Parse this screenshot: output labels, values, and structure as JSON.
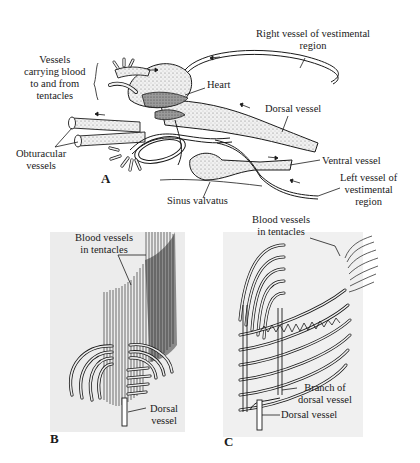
{
  "figure": {
    "panels": [
      {
        "id": "A",
        "letter": "A",
        "labels": {
          "right_vessel": [
            "Right vessel of vestimental",
            "region"
          ],
          "vessels_tentacles": [
            "Vessels",
            "carrying blood",
            "to and from",
            "tentacles"
          ],
          "heart": "Heart",
          "dorsal_vessel": "Dorsal vessel",
          "obturacular": [
            "Obturacular",
            "vessels"
          ],
          "ventral_vessel": "Ventral vessel",
          "left_vessel": [
            "Left vessel of",
            "vestimental",
            "region"
          ],
          "sinus_valvatus": "Sinus valvatus"
        }
      },
      {
        "id": "B",
        "letter": "B",
        "labels": {
          "blood_vessels": [
            "Blood vessels",
            "in tentacles"
          ],
          "dorsal_vessel": [
            "Dorsal",
            "vessel"
          ]
        }
      },
      {
        "id": "C",
        "letter": "C",
        "labels": {
          "blood_vessels": [
            "Blood vessels",
            "in tentacles"
          ],
          "branch": [
            "Branch of",
            "dorsal vessel"
          ],
          "dorsal_vessel": "Dorsal vessel"
        }
      }
    ],
    "colors": {
      "ink": "#1a1a1a",
      "stipple": "#d8d8d8",
      "dark_fill": "#8a8a8a",
      "panel_bg": "#ececec"
    }
  }
}
